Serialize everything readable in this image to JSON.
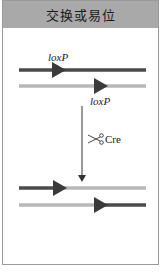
{
  "header": {
    "title": "交换或易位"
  },
  "labels": {
    "loxp_top": "loxP",
    "loxp_bottom": "loxP",
    "enzyme": "Cre"
  },
  "icons": {
    "enzyme_icon": "scissors-icon"
  },
  "colors": {
    "dark_strand": "#4a4a4a",
    "light_strand": "#b8b8b8",
    "header_bg": "#a9a9a9",
    "border": "#9a9a9a"
  }
}
